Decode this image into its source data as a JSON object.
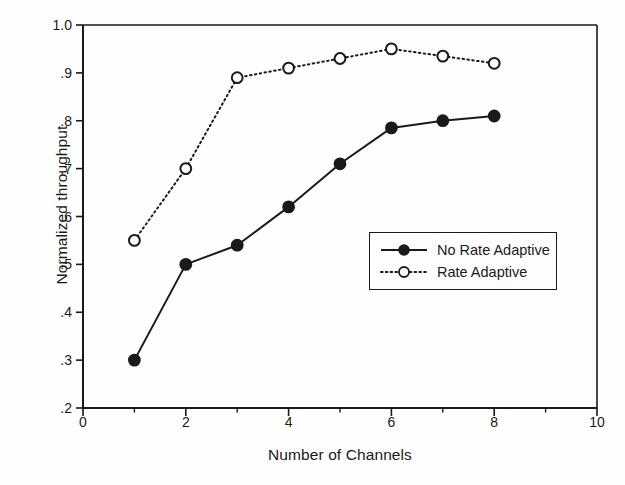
{
  "chart_data": {
    "type": "line",
    "title": "",
    "xlabel": "Number of Channels",
    "ylabel": "Normalized throughput",
    "xlim": [
      0,
      10
    ],
    "ylim": [
      0.2,
      1.0
    ],
    "grid": false,
    "legend_position": "center-right-inside",
    "x": [
      1,
      2,
      3,
      4,
      5,
      6,
      7,
      8
    ],
    "xticks": [
      0,
      2,
      4,
      6,
      8,
      10
    ],
    "xtick_labels": [
      "0",
      "2",
      "4",
      "6",
      "8",
      "10"
    ],
    "x_minor_ticks": [
      1,
      3,
      5,
      7,
      9
    ],
    "yticks": [
      0.2,
      0.3,
      0.4,
      0.5,
      0.6,
      0.7,
      0.8,
      0.9,
      1.0
    ],
    "ytick_labels": [
      ".2",
      ".3",
      ".4",
      ".5",
      ".6",
      ".7",
      ".8",
      ".9",
      "1.0"
    ],
    "series": [
      {
        "name": "No Rate Adaptive",
        "marker": "filled-circle",
        "linestyle": "solid",
        "color": "#1a1a1a",
        "values": [
          0.3,
          0.5,
          0.54,
          0.62,
          0.71,
          0.785,
          0.8,
          0.81
        ]
      },
      {
        "name": "Rate Adaptive",
        "marker": "open-circle",
        "linestyle": "dotted",
        "color": "#1a1a1a",
        "values": [
          0.55,
          0.7,
          0.89,
          0.91,
          0.93,
          0.95,
          0.935,
          0.92
        ]
      }
    ]
  },
  "legend": {
    "entries": [
      {
        "label": "No Rate Adaptive"
      },
      {
        "label": "Rate Adaptive"
      }
    ]
  },
  "colors": {
    "ink": "#1a1a1a",
    "paper": "#fefefe"
  }
}
